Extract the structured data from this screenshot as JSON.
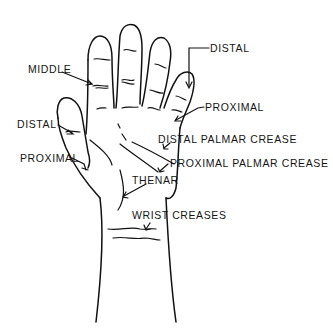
{
  "diagram": {
    "labels": {
      "middle": "MIDDLE",
      "distal_finger": "DISTAL",
      "proximal_finger": "PROXIMAL",
      "distal_thumb": "DISTAL",
      "proximal_thumb": "PROXIMAL",
      "distal_palmar_crease": "DISTAL PALMAR CREASE",
      "proximal_palmar_crease": "PROXIMAL PALMAR CREASE",
      "thenar": "THENAR",
      "wrist_creases": "WRIST CREASES"
    },
    "colors": {
      "background": "#ffffff",
      "ink": "#111111"
    }
  }
}
